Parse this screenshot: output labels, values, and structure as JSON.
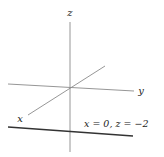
{
  "diagram": {
    "type": "3d-axes",
    "axes": [
      {
        "name": "z",
        "label": "z",
        "x1": 70,
        "y1": 22,
        "x2": 70,
        "y2": 152,
        "label_x": 70,
        "label_y": 16
      },
      {
        "name": "y",
        "label": "y",
        "x1": 8,
        "y1": 84,
        "x2": 134,
        "y2": 91,
        "label_x": 141,
        "label_y": 94
      },
      {
        "name": "x",
        "label": "x",
        "x1": 28,
        "y1": 115,
        "x2": 105,
        "y2": 66,
        "label_x": 20,
        "label_y": 122
      }
    ],
    "line": {
      "label": "x = 0, z = −2",
      "x1": 8,
      "y1": 127,
      "x2": 133,
      "y2": 136,
      "label_x": 84,
      "label_y": 127
    },
    "colors": {
      "axis": "#8a8a8a",
      "line": "#333333",
      "text": "#222222",
      "background": "#ffffff"
    }
  }
}
